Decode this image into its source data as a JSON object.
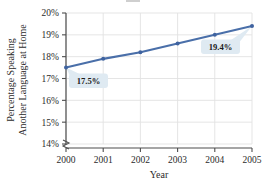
{
  "chart_data": {
    "type": "line",
    "title": "",
    "xlabel": "Year",
    "ylabel": "Percentage Speaking Another Language at Home",
    "ylabel_line1": "Percentage Speaking",
    "ylabel_line2": "Another Language at Home",
    "categories": [
      "2000",
      "2001",
      "2002",
      "2003",
      "2004",
      "2005"
    ],
    "x": [
      2000,
      2001,
      2002,
      2003,
      2004,
      2005
    ],
    "values": [
      17.5,
      17.9,
      18.2,
      18.6,
      19.0,
      19.4
    ],
    "series": [
      {
        "name": "Percentage Speaking Another Language at Home",
        "values": [
          17.5,
          17.9,
          18.2,
          18.6,
          19.0,
          19.4
        ]
      }
    ],
    "ylim": [
      14,
      20
    ],
    "yticks": [
      14,
      15,
      16,
      17,
      18,
      19,
      20
    ],
    "ytick_labels": [
      "14%",
      "15%",
      "16%",
      "17%",
      "18%",
      "19%",
      "20%"
    ],
    "xtick_labels": [
      "2000",
      "2001",
      "2002",
      "2003",
      "2004",
      "2005"
    ],
    "grid": true,
    "legend": false,
    "axis_break": true,
    "annotations": [
      {
        "label": "17.5%",
        "x": 2000,
        "y": 17.5
      },
      {
        "label": "19.4%",
        "x": 2005,
        "y": 19.4
      }
    ],
    "colors": {
      "line": "#4a6fa9",
      "marker": "#3f63a0",
      "grid": "#e2e2e2",
      "axis": "#4d4d4d",
      "callout_bg": "#dfeaf2",
      "text": "#2b2b2b"
    }
  }
}
